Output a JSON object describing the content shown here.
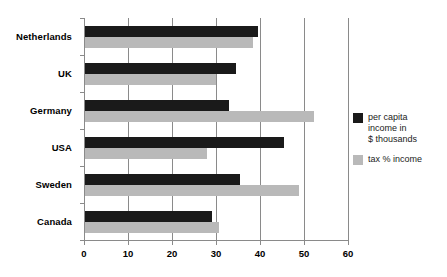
{
  "chart_data": {
    "type": "bar",
    "orientation": "horizontal",
    "title": "",
    "subtitle": "",
    "xlabel": "",
    "ylabel": "",
    "xlim": [
      0,
      60
    ],
    "xticks": [
      0,
      10,
      20,
      30,
      40,
      50,
      60
    ],
    "xtick_labels": [
      "0",
      "10",
      "20",
      "30",
      "40",
      "50",
      "60"
    ],
    "grid": true,
    "grid_axis": "x",
    "legend_position": "right",
    "categories": [
      "Netherlands",
      "UK",
      "Germany",
      "USA",
      "Sweden",
      "Canada"
    ],
    "series": [
      {
        "name": "per capita income in $ thousands",
        "color": "#1a1a1a",
        "values": [
          39.5,
          34.5,
          33.0,
          45.5,
          35.5,
          29.0
        ]
      },
      {
        "name": "tax % income",
        "color": "#b9b9b9",
        "values": [
          38.5,
          30.0,
          52.3,
          28.0,
          48.8,
          30.7
        ]
      }
    ]
  },
  "legend": {
    "entries": [
      {
        "label": "per capita\nincome in\n$ thousands",
        "color": "#1a1a1a"
      },
      {
        "label": "tax % income",
        "color": "#b9b9b9"
      }
    ]
  }
}
